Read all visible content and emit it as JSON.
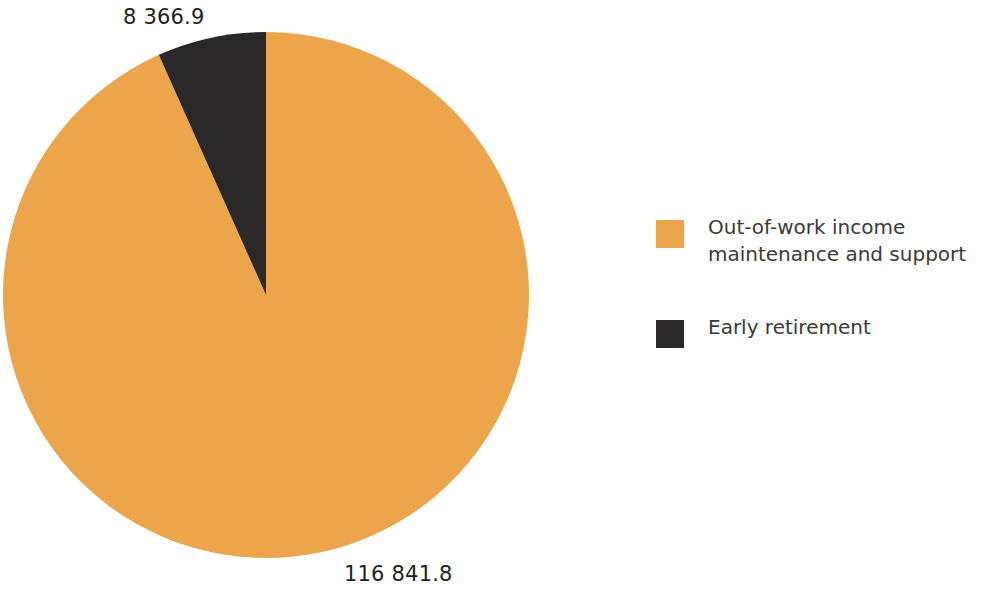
{
  "chart_data": {
    "type": "pie",
    "title": "",
    "subtitle": "",
    "xlabel": "",
    "ylabel": "",
    "categories": [
      "Out-of-work income maintenance and support",
      "Early retirement"
    ],
    "values": [
      116841.8,
      8366.9
    ],
    "value_labels": [
      "116 841.8",
      "8 366.9"
    ],
    "percentages": [
      93.32,
      6.68
    ],
    "colors": [
      "#eda54c",
      "#2a2828"
    ],
    "start_angle_deg": 90,
    "direction": "counterclockwise",
    "legend_position": "right",
    "grid": false,
    "slices": [
      {
        "name": "Out-of-work income maintenance and support",
        "value": 116841.8,
        "value_label": "116 841.8",
        "percent": 93.32,
        "color": "#eda54c"
      },
      {
        "name": "Early retirement",
        "value": 8366.9,
        "value_label": "8 366.9",
        "percent": 6.68,
        "color": "#2a2828"
      }
    ]
  },
  "labels": {
    "early_retirement_value": "8 366.9",
    "out_of_work_value": "116 841.8"
  },
  "legend": {
    "items": [
      {
        "label": "Out-of-work income maintenance and support",
        "color": "#eda54c",
        "swatch_name": "legend-swatch-out-of-work"
      },
      {
        "label": "Early retirement",
        "color": "#2a2828",
        "swatch_name": "legend-swatch-early-retirement"
      }
    ]
  },
  "colors": {
    "out_of_work": "#eda54c",
    "early_retirement": "#2a2828",
    "background": "#ffffff",
    "text": "#231f20",
    "legend_text": "#3a3a3a"
  }
}
